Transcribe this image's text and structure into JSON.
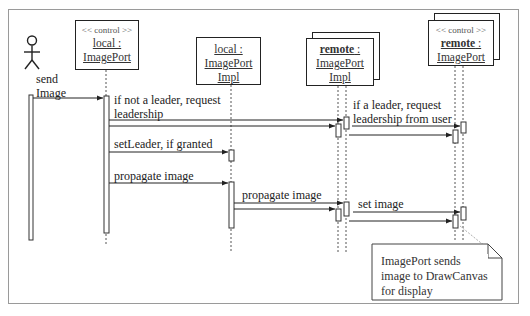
{
  "diagram": {
    "type": "sequence",
    "actor": {
      "name": "user",
      "icon": "stick-figure-icon"
    },
    "objects": [
      {
        "id": "local_imageport",
        "stereotype": "<< control >>",
        "line1": "local :",
        "line2": "ImagePort",
        "line3": "",
        "multi": false
      },
      {
        "id": "local_imageportimpl",
        "stereotype": "",
        "line1": "local :",
        "line2": "ImagePort",
        "line3": "Impl",
        "multi": false
      },
      {
        "id": "remote_imageportimpl",
        "stereotype": "",
        "line1_bold": "remote",
        "line1_rest": " :",
        "line2": "ImagePort",
        "line3": "Impl",
        "multi": true
      },
      {
        "id": "remote_imageport",
        "stereotype": "<< control >>",
        "line1_bold": "remote",
        "line1_rest": " :",
        "line2": "ImagePort",
        "line3": "",
        "multi": true
      }
    ],
    "messages": [
      {
        "label1": "send",
        "label2": "Image",
        "from": "actor",
        "to": "local_imageport"
      },
      {
        "label1": "if not a leader, request",
        "label2": "leadership",
        "from": "local_imageport",
        "to": "remote_imageportimpl"
      },
      {
        "label1": "if a leader, request",
        "label2": "leadership from user",
        "from": "remote_imageportimpl",
        "to": "remote_imageport"
      },
      {
        "label1": "setLeader, if granted",
        "from": "local_imageport",
        "to": "local_imageportimpl"
      },
      {
        "label1": "propagate image",
        "from": "local_imageport",
        "to": "local_imageportimpl"
      },
      {
        "label1": "propagate image",
        "from": "local_imageportimpl",
        "to": "remote_imageportimpl"
      },
      {
        "label1": "set image",
        "from": "remote_imageportimpl",
        "to": "remote_imageport"
      }
    ],
    "note": {
      "line1": "ImagePort sends",
      "line2": "image to DrawCanvas",
      "line3": "for display"
    }
  }
}
